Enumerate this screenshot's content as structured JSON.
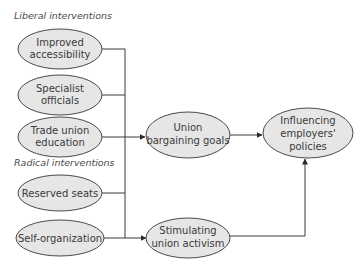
{
  "sections": {
    "liberal": "Liberal interventions",
    "radical": "Radical interventions"
  },
  "nodes": {
    "improved_accessibility": [
      "Improved",
      "accessibility"
    ],
    "specialist_officials": [
      "Specialist",
      "officials"
    ],
    "trade_union_education": [
      "Trade union",
      "education"
    ],
    "reserved_seats": [
      "Reserved seats"
    ],
    "self_organization": [
      "Self-organization"
    ],
    "union_bargaining_goals": [
      "Union",
      "bargaining goals"
    ],
    "stimulating_union_activism": [
      "Stimulating",
      "union activism"
    ],
    "influencing_employers_policies": [
      "Influencing",
      "employers'",
      "policies"
    ]
  },
  "edges": [
    {
      "from": "improved_accessibility",
      "to": "union_bargaining_goals"
    },
    {
      "from": "specialist_officials",
      "to": "union_bargaining_goals"
    },
    {
      "from": "trade_union_education",
      "to": "union_bargaining_goals"
    },
    {
      "from": "reserved_seats",
      "to": "stimulating_union_activism"
    },
    {
      "from": "self_organization",
      "to": "stimulating_union_activism"
    },
    {
      "from": "union_bargaining_goals",
      "to": "influencing_employers_policies"
    },
    {
      "from": "stimulating_union_activism",
      "to": "influencing_employers_policies"
    }
  ],
  "colors": {
    "node_fill": "#e6e6e6",
    "stroke": "#4a4a4a",
    "text": "#3a3a3a"
  }
}
